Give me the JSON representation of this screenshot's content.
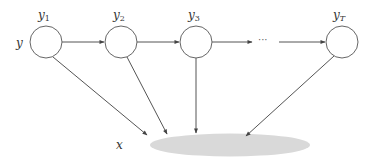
{
  "diagram": {
    "row_label": "y",
    "observation_label": "x",
    "ellipsis": "···",
    "nodes": [
      {
        "id": "y1",
        "base": "y",
        "sub": "1",
        "cx": 46,
        "cy": 42
      },
      {
        "id": "y2",
        "base": "y",
        "sub": "2",
        "cx": 121,
        "cy": 42
      },
      {
        "id": "y3",
        "base": "y",
        "sub": "3",
        "cx": 196,
        "cy": 42
      },
      {
        "id": "yT",
        "base": "y",
        "sub": "T",
        "cx": 342,
        "cy": 42
      }
    ],
    "chain_edges": [
      {
        "from": "y1",
        "to": "y2"
      },
      {
        "from": "y2",
        "to": "y3"
      },
      {
        "from": "y3",
        "to": "ellipsis"
      },
      {
        "from": "ellipsis",
        "to": "yT"
      }
    ],
    "emission_edges": [
      {
        "from": "y1",
        "to": "x"
      },
      {
        "from": "y2",
        "to": "x"
      },
      {
        "from": "y3",
        "to": "x"
      },
      {
        "from": "yT",
        "to": "x"
      }
    ],
    "colors": {
      "stroke": "#555555",
      "ellipse_fill": "#d9d9d9",
      "node_fill": "#ffffff"
    }
  }
}
